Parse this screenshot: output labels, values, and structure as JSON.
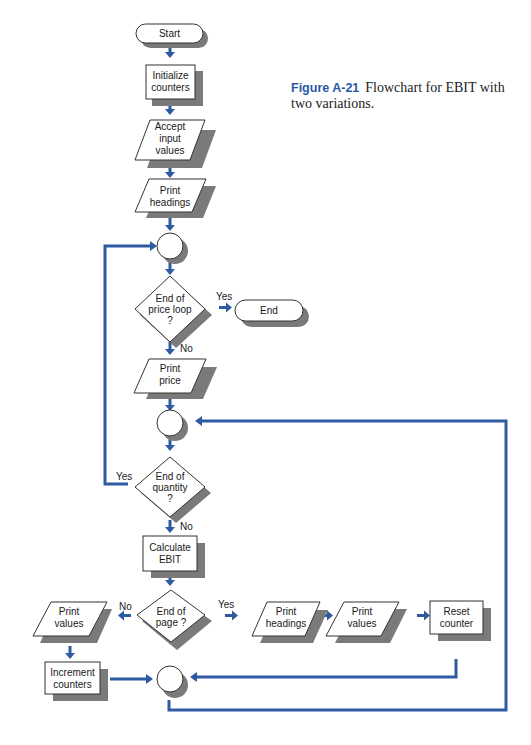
{
  "caption": {
    "figure_label": "Figure A-21",
    "text": "Flowchart for EBIT with two variations."
  },
  "colors": {
    "arrow": "#2d5aa0",
    "shadow": "#7a7a7a",
    "shape_stroke": "#333333",
    "figure_label": "#2a58a5"
  },
  "nodes": {
    "start": "Start",
    "init_1": "Initialize",
    "init_2": "counters",
    "accept_1": "Accept",
    "accept_2": "input",
    "accept_3": "values",
    "headings1_1": "Print",
    "headings1_2": "headings",
    "price_loop_1": "End of",
    "price_loop_2": "price loop",
    "price_loop_3": "?",
    "end": "End",
    "print_price_1": "Print",
    "print_price_2": "price",
    "quantity_1": "End of",
    "quantity_2": "quantity",
    "quantity_3": "?",
    "calc_1": "Calculate",
    "calc_2": "EBIT",
    "page_1": "End of",
    "page_2": "page  ?",
    "values_left_1": "Print",
    "values_left_2": "values",
    "increment_1": "Increment",
    "increment_2": "counters",
    "headings2_1": "Print",
    "headings2_2": "headings",
    "values_right_1": "Print",
    "values_right_2": "values",
    "reset_1": "Reset",
    "reset_2": "counter"
  },
  "edge_labels": {
    "price_yes": "Yes",
    "price_no": "No",
    "quantity_yes": "Yes",
    "quantity_no": "No",
    "page_no": "No",
    "page_yes": "Yes"
  }
}
